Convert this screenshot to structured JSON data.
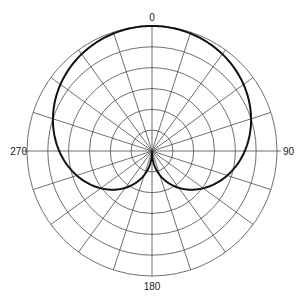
{
  "chart_data": {
    "type": "polar",
    "title": "",
    "angle_unit": "degrees",
    "angle_direction": "clockwise",
    "zero_location": "top",
    "angle_tick_labels": [
      {
        "angle": 0,
        "label": "0"
      },
      {
        "angle": 90,
        "label": "90"
      },
      {
        "angle": 180,
        "label": "180"
      },
      {
        "angle": 270,
        "label": "270"
      }
    ],
    "radial_gridlines_every_deg": 18,
    "ring_count": 6,
    "rlim": [
      0,
      1
    ],
    "grid": true,
    "legend": null,
    "series": [
      {
        "name": "cardioid pattern",
        "shape_exponent": 0.43,
        "theta": [
          0,
          18,
          36,
          54,
          72,
          90,
          108,
          126,
          144,
          162,
          180,
          198,
          216,
          234,
          252,
          270,
          288,
          306,
          324,
          342,
          360
        ],
        "r": [
          1.0,
          0.989,
          0.958,
          0.906,
          0.834,
          0.742,
          0.633,
          0.507,
          0.364,
          0.203,
          0.0,
          0.203,
          0.364,
          0.507,
          0.633,
          0.742,
          0.834,
          0.906,
          0.958,
          0.989,
          1.0
        ]
      }
    ]
  },
  "colors": {
    "grid": "#4a4a4a",
    "curve": "#111111",
    "label": "#222222",
    "background": "#ffffff"
  }
}
